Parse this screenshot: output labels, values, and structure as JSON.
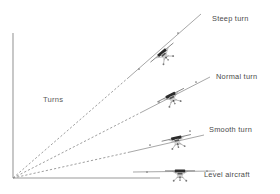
{
  "figure": {
    "title_label": "Turns",
    "background_color": "#ffffff",
    "axis_color": "#9a9a9a",
    "line_color": "#9d9d9d",
    "text_color": "#4a4a4a"
  },
  "chart_data": {
    "type": "diagram",
    "title": "Turns",
    "xlabel": "",
    "ylabel": "",
    "grid": false,
    "legend": "right",
    "origin": {
      "x": 13,
      "y": 178
    },
    "axes": {
      "vertical": {
        "x1": 13,
        "y1": 33,
        "x2": 13,
        "y2": 178
      },
      "horizontal": {
        "x1": 13,
        "y1": 178,
        "x2": 160,
        "y2": 178
      }
    },
    "series": [
      {
        "name": "Steep turn",
        "label": "Steep turn",
        "bank": "steep",
        "angle_deg": 41,
        "dashed_from": {
          "x": 13,
          "y": 178
        },
        "dashed_to": {
          "x": 128,
          "y": 78
        },
        "solid_from": {
          "x": 128,
          "y": 78
        },
        "solid_to": {
          "x": 201,
          "y": 14
        },
        "aircraft": {
          "x": 164,
          "y": 55,
          "roll_deg": -40
        },
        "label_pos": {
          "x": 212,
          "y": 21
        }
      },
      {
        "name": "Normal turn",
        "label": "Normal turn",
        "bank": "normal",
        "angle_deg": 27,
        "dashed_from": {
          "x": 13,
          "y": 178
        },
        "dashed_to": {
          "x": 140,
          "y": 113
        },
        "solid_from": {
          "x": 140,
          "y": 113
        },
        "solid_to": {
          "x": 210,
          "y": 77
        },
        "aircraft": {
          "x": 172,
          "y": 98,
          "roll_deg": -27
        },
        "label_pos": {
          "x": 216,
          "y": 79
        }
      },
      {
        "name": "Smooth turn",
        "label": "Smooth turn",
        "bank": "smooth",
        "angle_deg": 13,
        "dashed_from": {
          "x": 13,
          "y": 178
        },
        "dashed_to": {
          "x": 130,
          "y": 152
        },
        "solid_from": {
          "x": 130,
          "y": 152
        },
        "solid_to": {
          "x": 204,
          "y": 135
        },
        "aircraft": {
          "x": 177,
          "y": 141,
          "roll_deg": -13
        },
        "label_pos": {
          "x": 209,
          "y": 132
        }
      },
      {
        "name": "Level aircraft",
        "label": "Level aircraft",
        "bank": "level",
        "angle_deg": 0,
        "dashed_from": {
          "x": 13,
          "y": 178
        },
        "dashed_to": {
          "x": 13,
          "y": 178
        },
        "solid_from": {
          "x": 133,
          "y": 172
        },
        "solid_to": {
          "x": 215,
          "y": 171
        },
        "aircraft": {
          "x": 180,
          "y": 174,
          "roll_deg": 0
        },
        "label_pos": {
          "x": 204,
          "y": 177
        }
      }
    ],
    "annotations": [
      {
        "text": "Turns",
        "x": 43,
        "y": 102
      }
    ],
    "tick_dots": [
      {
        "x": 178,
        "y": 33
      },
      {
        "x": 139,
        "y": 69
      },
      {
        "x": 196,
        "y": 82
      },
      {
        "x": 159,
        "y": 102
      },
      {
        "x": 190,
        "y": 131
      },
      {
        "x": 150,
        "y": 145
      },
      {
        "x": 207,
        "y": 171
      },
      {
        "x": 147,
        "y": 172
      }
    ]
  }
}
